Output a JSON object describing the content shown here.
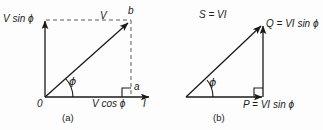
{
  "figure": {
    "background_color": "#fdfdfd",
    "stroke_color": "#1a1a1a",
    "panels": [
      {
        "id": "a",
        "caption": "(a)",
        "type": "voltage-current-phasor-diagram",
        "labels": {
          "v_sin_phi": "V sin ϕ",
          "v_cos_phi": "V cos ϕ",
          "vector_v": "V",
          "point_b": "b",
          "point_a": "a",
          "origin": "0",
          "axis_i": "I",
          "angle_phi": "ϕ"
        }
      },
      {
        "id": "b",
        "caption": "(b)",
        "type": "power-triangle",
        "labels": {
          "apparent_power": "S = VI",
          "reactive_power": "Q = VI sin ϕ",
          "real_power": "P = VI sin ϕ",
          "angle_phi": "ϕ"
        }
      }
    ]
  }
}
